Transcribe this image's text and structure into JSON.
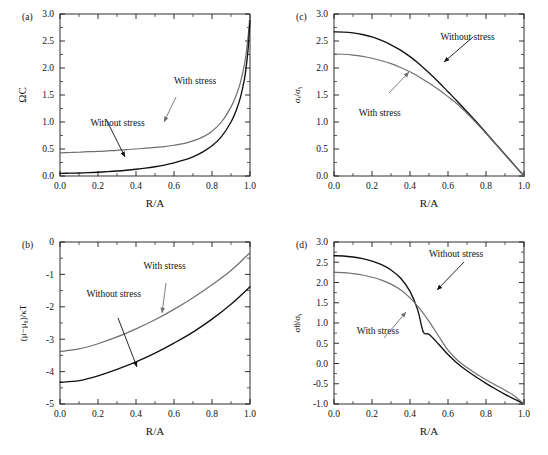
{
  "figure": {
    "background": "#ffffff",
    "panel_count": 4,
    "colors": {
      "with_stress": "#707070",
      "without_stress": "#111111",
      "axis": "#1a1a1a",
      "text": "#111111"
    },
    "series_labels": {
      "with_stress": "With stress",
      "without_stress": "Without stress"
    }
  },
  "chart_data": [
    {
      "type": "line",
      "panel": "(a)",
      "title": "",
      "xlabel": "R/A",
      "ylabel": "ΩC",
      "xlim": [
        0.0,
        1.0
      ],
      "ylim": [
        0.0,
        3.0
      ],
      "xticks": [
        "0.0",
        "0.2",
        "0.4",
        "0.6",
        "0.8",
        "1.0"
      ],
      "xtick_values": [
        0.0,
        0.2,
        0.4,
        0.6,
        0.8,
        1.0
      ],
      "yticks": [
        "0.0",
        "0.5",
        "1.0",
        "1.5",
        "2.0",
        "2.5",
        "3.0"
      ],
      "ytick_values": [
        0.0,
        0.5,
        1.0,
        1.5,
        2.0,
        2.5,
        3.0
      ],
      "grid": false,
      "legend_position": "in-plot annotations with arrows",
      "annotations": [
        {
          "text": "With stress",
          "x": 0.6,
          "y": 1.7
        },
        {
          "text": "Without stress",
          "x": 0.16,
          "y": 0.92
        }
      ],
      "series": [
        {
          "name": "With stress",
          "color": "#707070",
          "x": [
            0.0,
            0.05,
            0.1,
            0.15,
            0.2,
            0.25,
            0.3,
            0.35,
            0.4,
            0.45,
            0.5,
            0.55,
            0.6,
            0.65,
            0.7,
            0.75,
            0.8,
            0.85,
            0.9,
            0.93,
            0.95,
            0.97,
            0.98,
            0.99,
            1.0
          ],
          "y": [
            0.43,
            0.435,
            0.44,
            0.45,
            0.455,
            0.465,
            0.475,
            0.49,
            0.5,
            0.515,
            0.53,
            0.545,
            0.57,
            0.6,
            0.65,
            0.72,
            0.83,
            1.0,
            1.28,
            1.52,
            1.74,
            2.05,
            2.28,
            2.58,
            2.98
          ]
        },
        {
          "name": "Without stress",
          "color": "#111111",
          "x": [
            0.0,
            0.05,
            0.1,
            0.15,
            0.2,
            0.25,
            0.3,
            0.35,
            0.4,
            0.45,
            0.5,
            0.55,
            0.6,
            0.65,
            0.7,
            0.75,
            0.8,
            0.85,
            0.9,
            0.93,
            0.95,
            0.97,
            0.98,
            0.99,
            1.0
          ],
          "y": [
            0.05,
            0.052,
            0.056,
            0.062,
            0.07,
            0.08,
            0.092,
            0.107,
            0.125,
            0.146,
            0.172,
            0.203,
            0.242,
            0.292,
            0.356,
            0.442,
            0.56,
            0.73,
            1.0,
            1.24,
            1.46,
            1.78,
            2.02,
            2.35,
            2.88
          ]
        }
      ]
    },
    {
      "type": "line",
      "panel": "(b)",
      "title": "",
      "xlabel": "R/A",
      "ylabel": "(μ−μ₀)/κT",
      "xlim": [
        0.0,
        1.0
      ],
      "ylim": [
        -5.0,
        0.0
      ],
      "xticks": [
        "0.0",
        "0.2",
        "0.4",
        "0.6",
        "0.8",
        "1.0"
      ],
      "xtick_values": [
        0.0,
        0.2,
        0.4,
        0.6,
        0.8,
        1.0
      ],
      "yticks": [
        "-5",
        "-4",
        "-3",
        "-2",
        "-1",
        "0"
      ],
      "ytick_values": [
        -5,
        -4,
        -3,
        -2,
        -1,
        0
      ],
      "grid": false,
      "legend_position": "in-plot annotations with arrows",
      "annotations": [
        {
          "text": "With stress",
          "x": 0.44,
          "y": -0.82
        },
        {
          "text": "Without stress",
          "x": 0.14,
          "y": -1.7
        }
      ],
      "series": [
        {
          "name": "With stress",
          "color": "#707070",
          "x": [
            0.0,
            0.1,
            0.2,
            0.3,
            0.4,
            0.5,
            0.6,
            0.7,
            0.8,
            0.9,
            1.0
          ],
          "y": [
            -3.38,
            -3.3,
            -3.14,
            -2.93,
            -2.68,
            -2.4,
            -2.08,
            -1.72,
            -1.32,
            -0.88,
            -0.33
          ]
        },
        {
          "name": "Without stress",
          "color": "#111111",
          "x": [
            0.0,
            0.1,
            0.2,
            0.3,
            0.4,
            0.5,
            0.6,
            0.7,
            0.8,
            0.9,
            1.0
          ],
          "y": [
            -4.33,
            -4.28,
            -4.13,
            -3.93,
            -3.7,
            -3.43,
            -3.12,
            -2.78,
            -2.38,
            -1.92,
            -1.38
          ]
        }
      ]
    },
    {
      "type": "line",
      "panel": "(c)",
      "title": "",
      "xlabel": "R/A",
      "ylabel": "σᵣ/σᵧ",
      "xlim": [
        0.0,
        1.0
      ],
      "ylim": [
        0.0,
        3.0
      ],
      "xticks": [
        "0.0",
        "0.2",
        "0.4",
        "0.6",
        "0.8",
        "1.0"
      ],
      "xtick_values": [
        0.0,
        0.2,
        0.4,
        0.6,
        0.8,
        1.0
      ],
      "yticks": [
        "0.0",
        "0.5",
        "1.0",
        "1.5",
        "2.0",
        "2.5",
        "3.0"
      ],
      "ytick_values": [
        0.0,
        0.5,
        1.0,
        1.5,
        2.0,
        2.5,
        3.0
      ],
      "grid": false,
      "legend_position": "in-plot annotations with arrows",
      "annotations": [
        {
          "text": "Without stress",
          "x": 0.56,
          "y": 2.52
        },
        {
          "text": "With stress",
          "x": 0.13,
          "y": 1.12
        }
      ],
      "series": [
        {
          "name": "Without stress",
          "color": "#111111",
          "x": [
            0.0,
            0.05,
            0.1,
            0.15,
            0.2,
            0.25,
            0.3,
            0.35,
            0.4,
            0.45,
            0.5,
            0.55,
            0.6,
            0.65,
            0.7,
            0.75,
            0.8,
            0.85,
            0.9,
            0.95,
            1.0
          ],
          "y": [
            2.67,
            2.665,
            2.65,
            2.62,
            2.575,
            2.51,
            2.43,
            2.33,
            2.21,
            2.07,
            1.91,
            1.74,
            1.56,
            1.38,
            1.19,
            1.0,
            0.8,
            0.6,
            0.4,
            0.2,
            0.0
          ]
        },
        {
          "name": "With stress",
          "color": "#707070",
          "x": [
            0.0,
            0.05,
            0.1,
            0.15,
            0.2,
            0.25,
            0.3,
            0.35,
            0.4,
            0.45,
            0.5,
            0.55,
            0.6,
            0.65,
            0.7,
            0.75,
            0.8,
            0.85,
            0.9,
            0.95,
            1.0
          ],
          "y": [
            2.26,
            2.255,
            2.24,
            2.215,
            2.18,
            2.135,
            2.08,
            2.01,
            1.93,
            1.83,
            1.72,
            1.6,
            1.47,
            1.33,
            1.16,
            0.98,
            0.79,
            0.59,
            0.39,
            0.195,
            0.0
          ]
        }
      ]
    },
    {
      "type": "line",
      "panel": "(d)",
      "title": "",
      "xlabel": "R/A",
      "ylabel": "σθ/σᵧ",
      "xlim": [
        0.0,
        1.0
      ],
      "ylim": [
        -1.0,
        3.0
      ],
      "xticks": [
        "0.0",
        "0.2",
        "0.4",
        "0.6",
        "0.8",
        "1.0"
      ],
      "xtick_values": [
        0.0,
        0.2,
        0.4,
        0.6,
        0.8,
        1.0
      ],
      "yticks": [
        "-1.0",
        "-0.5",
        "0.0",
        "0.5",
        "1.0",
        "1.5",
        "2.0",
        "2.5",
        "3.0"
      ],
      "ytick_values": [
        -1.0,
        -0.5,
        0.0,
        0.5,
        1.0,
        1.5,
        2.0,
        2.5,
        3.0
      ],
      "grid": false,
      "legend_position": "in-plot annotations with arrows",
      "annotations": [
        {
          "text": "Without stress",
          "x": 0.5,
          "y": 2.62
        },
        {
          "text": "With stress",
          "x": 0.12,
          "y": 0.72
        }
      ],
      "series": [
        {
          "name": "Without stress",
          "color": "#111111",
          "x": [
            0.0,
            0.05,
            0.1,
            0.15,
            0.2,
            0.25,
            0.3,
            0.35,
            0.4,
            0.44,
            0.47,
            0.5,
            0.55,
            0.6,
            0.65,
            0.7,
            0.75,
            0.8,
            0.85,
            0.9,
            0.95,
            1.0
          ],
          "y": [
            2.66,
            2.655,
            2.63,
            2.59,
            2.53,
            2.44,
            2.31,
            2.11,
            1.78,
            1.33,
            0.78,
            0.72,
            0.48,
            0.22,
            0.0,
            -0.18,
            -0.34,
            -0.49,
            -0.63,
            -0.76,
            -0.88,
            -1.0
          ]
        },
        {
          "name": "With stress",
          "color": "#707070",
          "x": [
            0.0,
            0.05,
            0.1,
            0.15,
            0.2,
            0.25,
            0.3,
            0.35,
            0.4,
            0.45,
            0.5,
            0.55,
            0.6,
            0.65,
            0.7,
            0.75,
            0.8,
            0.85,
            0.9,
            0.95,
            1.0
          ],
          "y": [
            2.25,
            2.245,
            2.22,
            2.185,
            2.13,
            2.06,
            1.96,
            1.82,
            1.62,
            1.36,
            1.04,
            0.68,
            0.33,
            0.08,
            -0.1,
            -0.26,
            -0.4,
            -0.53,
            -0.66,
            -0.8,
            -1.0
          ]
        }
      ]
    }
  ]
}
